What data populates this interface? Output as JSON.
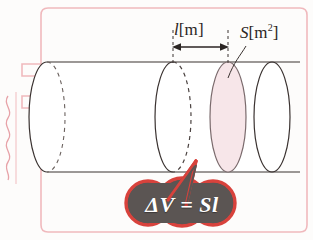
{
  "figure": {
    "labels": {
      "length": {
        "symbol": "l",
        "unit": "[m]"
      },
      "area": {
        "symbol": "S",
        "unit_open": "[m",
        "unit_exp": "2",
        "unit_close": "]"
      }
    },
    "formula": {
      "text": "ΔV = Sl",
      "bubble_fill": "#5b5553",
      "bubble_stroke": "#d8423c"
    },
    "colors": {
      "page_background": "#fdfcfb",
      "frame_border": "#f0b9bd",
      "outline": "#3a3230",
      "hidden_edge": "#6b625f",
      "slice_fill": "#f7e6e9",
      "slice_stroke": "#7a6a6c",
      "accent_pink": "#e9a0a6",
      "text": "#2b2523"
    },
    "geometry": {
      "cylinder_top_y": 62,
      "cylinder_bottom_y": 172,
      "left_cap_cx": 47,
      "mid_cap_cx": 173,
      "slice_cap_cx": 228,
      "right_cap_cx": 272,
      "cap_rx": 18,
      "cap_ry": 55
    },
    "annotations": {
      "dimension_arrow": "double-headed horizontal arrow between the two dashed extension lines",
      "leader_line": "curved leader from S label to the shaded slice face"
    }
  }
}
